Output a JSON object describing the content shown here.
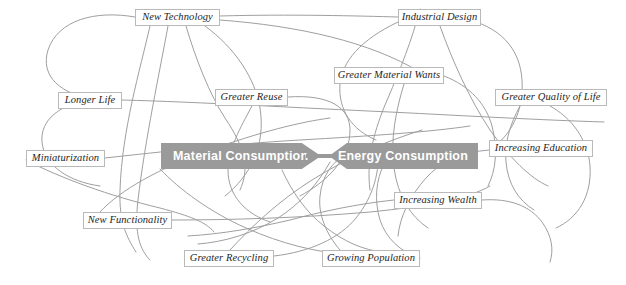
{
  "diagram": {
    "type": "concept-map",
    "background_color": "#ffffff",
    "edge_color": "#9f9f9f",
    "banner_color": "#9a9a9a",
    "banner_text_color": "#ffffff",
    "node_border_color": "#b9b9b9",
    "node_text_color": "#1e1e1e"
  },
  "banners": [
    {
      "id": "material-consumption",
      "label": "Material Consumption",
      "direction": "right",
      "x": 161,
      "y": 143,
      "width": 148,
      "height": 26
    },
    {
      "id": "energy-consumption",
      "label": "Energy Consumption",
      "direction": "left",
      "x": 329,
      "y": 143,
      "width": 139,
      "height": 26
    }
  ],
  "nodes": [
    {
      "id": "new-technology",
      "label": "New Technology",
      "x": 135,
      "y": 9,
      "width": 85
    },
    {
      "id": "industrial-design",
      "label": "Industrial Design",
      "x": 398,
      "y": 9,
      "width": 83
    },
    {
      "id": "greater-material-wants",
      "label": "Greater Material Wants",
      "x": 334,
      "y": 67,
      "width": 110
    },
    {
      "id": "greater-reuse",
      "label": "Greater Reuse",
      "x": 215,
      "y": 89,
      "width": 73
    },
    {
      "id": "greater-quality-of-life",
      "label": "Greater Quality of Life",
      "x": 495,
      "y": 89,
      "width": 112
    },
    {
      "id": "longer-life",
      "label": "Longer Life",
      "x": 58,
      "y": 92,
      "width": 64
    },
    {
      "id": "increasing-education",
      "label": "Increasing Education",
      "x": 489,
      "y": 140,
      "width": 104
    },
    {
      "id": "miniaturization",
      "label": "Miniaturization",
      "x": 26,
      "y": 150,
      "width": 79
    },
    {
      "id": "increasing-wealth",
      "label": "Increasing Wealth",
      "x": 394,
      "y": 192,
      "width": 88
    },
    {
      "id": "new-functionality",
      "label": "New Functionality",
      "x": 83,
      "y": 212,
      "width": 89
    },
    {
      "id": "greater-recycling",
      "label": "Greater Recycling",
      "x": 184,
      "y": 250,
      "width": 90
    },
    {
      "id": "growing-population",
      "label": "Growing Population",
      "x": 322,
      "y": 250,
      "width": 98
    }
  ],
  "edges": [
    {
      "id": "e1",
      "path": "M 135,17 C 95,10 58,20 48,50 C 40,76 60,95 98,100"
    },
    {
      "id": "e2",
      "path": "M 150,26 C 140,70 122,130 120,190 C 119,222 126,236 136,252"
    },
    {
      "id": "e3",
      "path": "M 168,26 C 160,70 145,140 138,200 C 134,234 140,250 150,260"
    },
    {
      "id": "e4",
      "path": "M 186,26 C 196,60 210,95 225,118 C 245,148 250,168 240,190"
    },
    {
      "id": "e5",
      "path": "M 205,26 C 235,48 255,78 260,108 C 266,146 250,176 225,196"
    },
    {
      "id": "e6",
      "path": "M 220,16 C 290,14 360,16 398,17"
    },
    {
      "id": "e7",
      "path": "M 220,20 C 300,26 370,42 420,72"
    },
    {
      "id": "e8",
      "path": "M 90,100 C 60,104 40,120 42,142 C 44,166 70,182 100,186"
    },
    {
      "id": "e9",
      "path": "M 122,100 C 200,102 300,108 390,112 C 470,116 540,120 604,122"
    },
    {
      "id": "e10",
      "path": "M 105,158 C 160,152 230,144 300,140 C 370,136 430,132 470,126"
    },
    {
      "id": "e11",
      "path": "M 26,160 C 60,178 110,196 160,208 C 190,216 206,222 214,232"
    },
    {
      "id": "e12",
      "path": "M 288,97 C 330,94 350,108 350,130 C 350,160 326,182 300,196"
    },
    {
      "id": "e13",
      "path": "M 252,106 C 240,128 228,150 228,170 C 228,196 246,214 270,222"
    },
    {
      "id": "e14",
      "path": "M 172,220 C 230,220 300,218 370,212 C 430,206 470,198 490,186"
    },
    {
      "id": "e15",
      "path": "M 100,212 C 120,190 160,168 210,150 C 260,132 300,122 330,118"
    },
    {
      "id": "e16",
      "path": "M 274,256 C 310,252 340,238 356,218 C 374,196 380,170 378,148"
    },
    {
      "id": "e17",
      "path": "M 230,250 C 252,226 280,200 312,180 C 350,156 390,140 422,130"
    },
    {
      "id": "e18",
      "path": "M 420,9 C 412,40 400,70 388,98 C 374,130 366,160 370,190"
    },
    {
      "id": "e19",
      "path": "M 440,26 C 452,60 470,100 490,130 C 510,158 530,178 548,186"
    },
    {
      "id": "e20",
      "path": "M 462,18 C 500,26 520,48 522,80 C 524,112 510,136 492,148"
    },
    {
      "id": "e21",
      "path": "M 398,22 C 360,40 342,62 340,84 C 338,110 352,130 376,140"
    },
    {
      "id": "e22",
      "path": "M 444,76 C 470,86 486,104 492,126 C 498,150 496,170 488,186"
    },
    {
      "id": "e23",
      "path": "M 404,84 C 396,110 390,140 394,168 C 398,196 410,216 428,228"
    },
    {
      "id": "e24",
      "path": "M 550,106 C 572,118 588,140 590,166 C 592,196 578,218 556,228"
    },
    {
      "id": "e25",
      "path": "M 520,106 C 510,124 504,144 506,162 C 508,184 518,200 534,210"
    },
    {
      "id": "e26",
      "path": "M 489,150 C 462,152 440,162 426,178 C 410,196 400,216 398,236"
    },
    {
      "id": "e27",
      "path": "M 420,258 C 400,252 386,238 380,220 C 374,200 376,180 384,164"
    },
    {
      "id": "e28",
      "path": "M 340,250 C 326,234 318,214 320,196 C 322,176 332,162 346,154"
    },
    {
      "id": "e29",
      "path": "M 482,200 C 510,198 530,206 542,222 C 552,236 554,250 550,262"
    },
    {
      "id": "e30",
      "path": "M 394,200 C 356,204 320,212 290,220 C 256,228 222,234 188,236"
    },
    {
      "id": "e31",
      "path": "M 160,169 C 180,190 210,212 246,228 C 282,244 316,252 344,254"
    },
    {
      "id": "e32",
      "path": "M 330,162 C 318,184 300,204 278,218 C 252,234 224,242 198,244"
    },
    {
      "id": "e33",
      "path": "M 282,170 C 292,192 306,212 324,226 C 344,242 364,250 382,252"
    }
  ]
}
